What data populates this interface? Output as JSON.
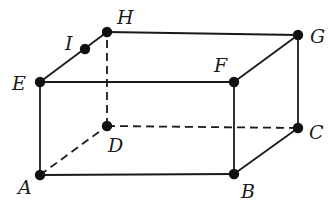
{
  "diagram": {
    "type": "rectangular-prism",
    "colors": {
      "stroke": "#1a1a1a",
      "point": "#111111",
      "background": "#ffffff"
    },
    "points": [
      {
        "id": "A",
        "label": "A",
        "x": 40,
        "y": 175,
        "lx": 18,
        "ly": 194
      },
      {
        "id": "B",
        "label": "B",
        "x": 234,
        "y": 174,
        "lx": 241,
        "ly": 198
      },
      {
        "id": "C",
        "label": "C",
        "x": 298,
        "y": 128,
        "lx": 309,
        "ly": 139
      },
      {
        "id": "D",
        "label": "D",
        "x": 107,
        "y": 126,
        "lx": 108,
        "ly": 152
      },
      {
        "id": "E",
        "label": "E",
        "x": 40,
        "y": 82,
        "lx": 12,
        "ly": 90
      },
      {
        "id": "F",
        "label": "F",
        "x": 234,
        "y": 82,
        "lx": 214,
        "ly": 72
      },
      {
        "id": "G",
        "label": "G",
        "x": 298,
        "y": 35,
        "lx": 310,
        "ly": 43
      },
      {
        "id": "H",
        "label": "H",
        "x": 107,
        "y": 32,
        "lx": 117,
        "ly": 24
      },
      {
        "id": "I",
        "label": "I",
        "x": 85,
        "y": 49,
        "lx": 65,
        "ly": 50
      }
    ],
    "edges": [
      {
        "from": "A",
        "to": "B",
        "style": "solid"
      },
      {
        "from": "B",
        "to": "C",
        "style": "solid"
      },
      {
        "from": "C",
        "to": "G",
        "style": "solid"
      },
      {
        "from": "B",
        "to": "F",
        "style": "solid"
      },
      {
        "from": "A",
        "to": "E",
        "style": "solid"
      },
      {
        "from": "E",
        "to": "F",
        "style": "solid"
      },
      {
        "from": "F",
        "to": "G",
        "style": "solid"
      },
      {
        "from": "G",
        "to": "H",
        "style": "solid"
      },
      {
        "from": "E",
        "to": "H",
        "style": "solid"
      },
      {
        "from": "A",
        "to": "D",
        "style": "dashed"
      },
      {
        "from": "D",
        "to": "C",
        "style": "dashed"
      },
      {
        "from": "D",
        "to": "H",
        "style": "dashed"
      }
    ]
  }
}
